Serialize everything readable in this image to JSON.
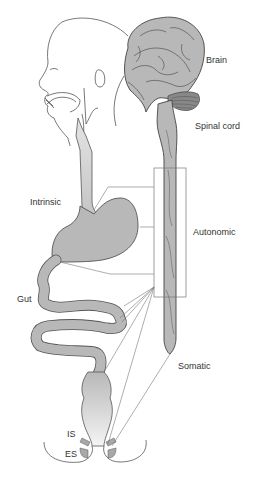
{
  "labels": {
    "brain": "Brain",
    "spinal_cord": "Spinal cord",
    "intrinsic": "Intrinsic",
    "autonomic": "Autonomic",
    "gut": "Gut",
    "somatic": "Somatic",
    "internal_sphincter": "IS",
    "external_sphincter": "ES"
  },
  "colors": {
    "organ_fill": "#b8b8b8",
    "outline": "#555555",
    "line": "#777777",
    "text": "#333333",
    "background": "#ffffff"
  }
}
